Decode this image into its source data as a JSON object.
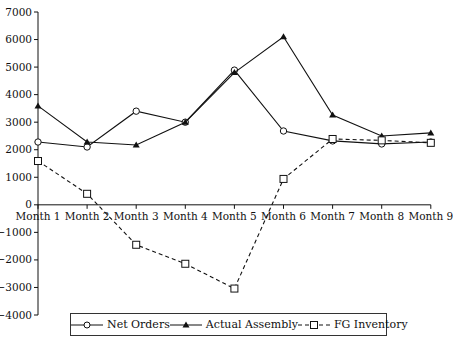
{
  "chart_data": {
    "type": "line",
    "title": "",
    "xlabel": "",
    "ylabel": "",
    "categories": [
      "Month 1",
      "Month 2",
      "Month 3",
      "Month 4",
      "Month 5",
      "Month 6",
      "Month 7",
      "Month 8",
      "Month 9"
    ],
    "ylim": [
      -4000,
      7000
    ],
    "yticks": [
      7000,
      6000,
      5000,
      4000,
      3000,
      2000,
      1000,
      0,
      -1000,
      -2000,
      -3000,
      -4000
    ],
    "grid": false,
    "legend_position": "bottom",
    "series": [
      {
        "name": "Net Orders",
        "marker": "open-circle",
        "line": "solid",
        "color": "#111111",
        "values": [
          2280,
          2100,
          3400,
          3000,
          4890,
          2680,
          2320,
          2210,
          2280
        ]
      },
      {
        "name": "Actual Assembly",
        "marker": "filled-triangle",
        "line": "solid",
        "color": "#111111",
        "values": [
          3590,
          2280,
          2170,
          3000,
          4800,
          6100,
          3260,
          2500,
          2610
        ]
      },
      {
        "name": "FG Inventory",
        "marker": "open-square",
        "line": "dashed",
        "color": "#111111",
        "values": [
          1590,
          400,
          -1450,
          -2140,
          -3040,
          940,
          2390,
          2340,
          2250
        ]
      }
    ]
  },
  "legend": {
    "items": [
      {
        "label": "Net Orders"
      },
      {
        "label": "Actual Assembly"
      },
      {
        "label": "FG Inventory"
      }
    ]
  }
}
